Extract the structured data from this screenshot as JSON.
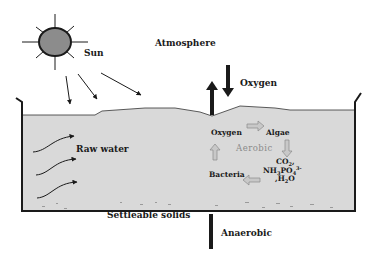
{
  "diagram": {
    "type": "waste stabilization pond schematic",
    "labels": {
      "sun": "Sun",
      "atmosphere": "Atmosphere",
      "oxygen_top": "Oxygen",
      "raw_water": "Raw water",
      "oxygen_cycle": "Oxygen",
      "algae": "Algae",
      "aerobic": "Aerobic",
      "co2": "CO",
      "co2_sub": "2",
      "nh3": "NH",
      "nh3_sub": "3",
      "po4": "PO",
      "po4_sub": "4",
      "po4_sup": "3-",
      "h2o": "H",
      "h2o_sub": "2",
      "h2o_o": "O",
      "bacteria": "Bacteria",
      "settleable_solids": "Settleable solids",
      "anaerobic": "Anaerobic"
    },
    "colors": {
      "water": "#d9d9d9",
      "ink": "#1a1a1a",
      "sun_fill": "#8c8c8c",
      "cycle_arrow": "#a8a8a8",
      "aerobic_text": "#8a8a8a"
    },
    "cycle": [
      "Oxygen",
      "Algae",
      "CO2, NH3, PO4 3-, H2O",
      "Bacteria"
    ]
  }
}
